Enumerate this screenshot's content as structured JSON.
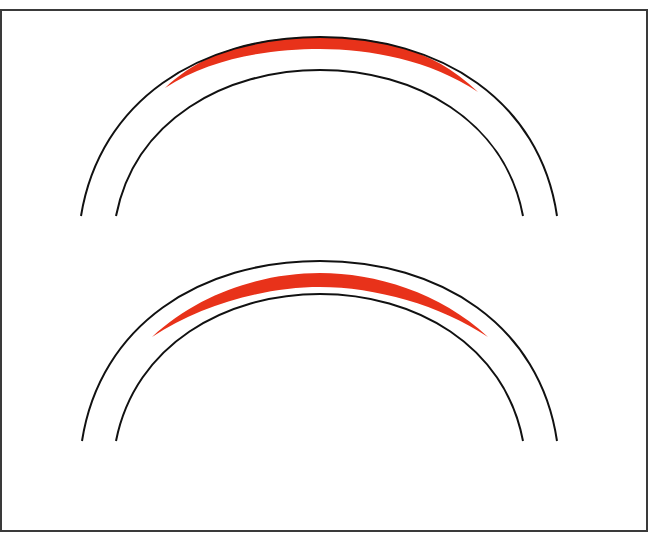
{
  "figure": {
    "colors": {
      "stroke": "#111111",
      "highlight": "#e8321a",
      "border": "#3a3a3a",
      "background": "#ffffff"
    },
    "panels": [
      {
        "id": "top",
        "outer_arc": {
          "left": [
            81,
            216
          ],
          "peak": [
            320,
            37
          ],
          "right": [
            557,
            216
          ]
        },
        "inner_arc": {
          "left": [
            116,
            216
          ],
          "peak": [
            320,
            70
          ],
          "right": [
            523,
            216
          ]
        },
        "red_region": "crescent along inner edge of outer arc, from x≈165 to x≈478, max thickness ≈12px at top"
      },
      {
        "id": "bottom",
        "outer_arc": {
          "left": [
            82,
            441
          ],
          "peak": [
            320,
            261
          ],
          "right": [
            557,
            441
          ]
        },
        "inner_arc": {
          "left": [
            116,
            441
          ],
          "peak": [
            320,
            294
          ],
          "right": [
            523,
            441
          ]
        },
        "red_region": "free-floating crescent between arcs, from (152,337) to (488,337), max thickness ≈14px at top"
      }
    ]
  }
}
